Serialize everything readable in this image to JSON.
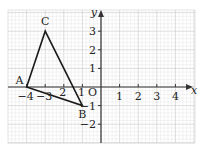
{
  "diagram": {
    "type": "coordinate-grid-triangle",
    "axes": {
      "x_label": "x",
      "y_label": "y",
      "origin_label": "O",
      "x_ticks": [
        {
          "value": -4,
          "label": "−4"
        },
        {
          "value": -3,
          "label": "−3"
        },
        {
          "value": -2,
          "label": "2"
        },
        {
          "value": -1,
          "label": "1"
        },
        {
          "value": 1,
          "label": "1"
        },
        {
          "value": 2,
          "label": "2"
        },
        {
          "value": 3,
          "label": "3"
        },
        {
          "value": 4,
          "label": "4"
        }
      ],
      "y_ticks": [
        {
          "value": 3,
          "label": "3"
        },
        {
          "value": 2,
          "label": "2"
        },
        {
          "value": 1,
          "label": "1"
        },
        {
          "value": -1,
          "label": "−1"
        },
        {
          "value": -2,
          "label": "−2"
        }
      ],
      "x_range": [
        -5,
        5
      ],
      "y_range": [
        -3,
        4
      ]
    },
    "triangle": {
      "vertices": [
        {
          "name": "A",
          "x": -4,
          "y": 0
        },
        {
          "name": "B",
          "x": -1,
          "y": -1
        },
        {
          "name": "C",
          "x": -3,
          "y": 3
        }
      ]
    },
    "colors": {
      "grid_minor": "#e6e6e6",
      "grid_major": "#cfcfcf",
      "axis": "#333333",
      "triangle": "#1a1a1a"
    }
  }
}
